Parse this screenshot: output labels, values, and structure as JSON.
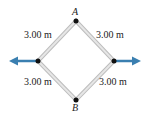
{
  "diagram": {
    "vertices": {
      "top": {
        "label": "A"
      },
      "bottom": {
        "label": "B"
      }
    },
    "sides": [
      {
        "position": "top-left",
        "length": "3.00 m"
      },
      {
        "position": "top-right",
        "length": "3.00 m"
      },
      {
        "position": "bottom-left",
        "length": "3.00 m"
      },
      {
        "position": "bottom-right",
        "length": "3.00 m"
      }
    ],
    "arrows": [
      {
        "direction": "left"
      },
      {
        "direction": "right"
      }
    ],
    "colors": {
      "rod": "#c8c8c8",
      "arrow": "#3a7fb0",
      "node": "#111111"
    }
  }
}
